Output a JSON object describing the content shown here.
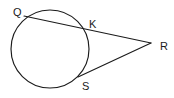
{
  "figure": {
    "kind": "geometry-diagram",
    "width": 174,
    "height": 98,
    "background_color": "#ffffff",
    "stroke_color": "#1b1b1b",
    "stroke_width": 1.15
  },
  "labels": {
    "q": "Q",
    "k": "K",
    "r": "R",
    "s": "S"
  },
  "chart_data": {
    "type": "scatter",
    "xlabel": "",
    "ylabel": "",
    "xlim": [
      0,
      174
    ],
    "ylim": [
      0,
      98
    ],
    "grid": false,
    "legend": "none",
    "shapes": [
      {
        "name": "circle",
        "type": "circle",
        "cx": 50,
        "cy": 49,
        "r": 39,
        "stroke": "#1b1b1b",
        "fill": "none"
      },
      {
        "name": "secant-q-to-r",
        "type": "line",
        "from": [
          24,
          16
        ],
        "to": [
          151,
          43
        ],
        "through": [
          83,
          28
        ],
        "stroke": "#1b1b1b"
      },
      {
        "name": "tangent-s-to-r",
        "type": "line",
        "from": [
          78,
          77
        ],
        "to": [
          151,
          43
        ],
        "stroke": "#1b1b1b"
      }
    ],
    "points": [
      {
        "label": "Q",
        "x": 24,
        "y": 16,
        "on": "circle",
        "label_x": 13,
        "label_y": 7
      },
      {
        "label": "K",
        "x": 83,
        "y": 28,
        "on": "circle",
        "label_x": 89,
        "label_y": 19
      },
      {
        "label": "R",
        "x": 151,
        "y": 43,
        "on": "exterior",
        "label_x": 160,
        "label_y": 41
      },
      {
        "label": "S",
        "x": 78,
        "y": 77,
        "on": "circle",
        "label_x": 82,
        "label_y": 81
      }
    ]
  }
}
